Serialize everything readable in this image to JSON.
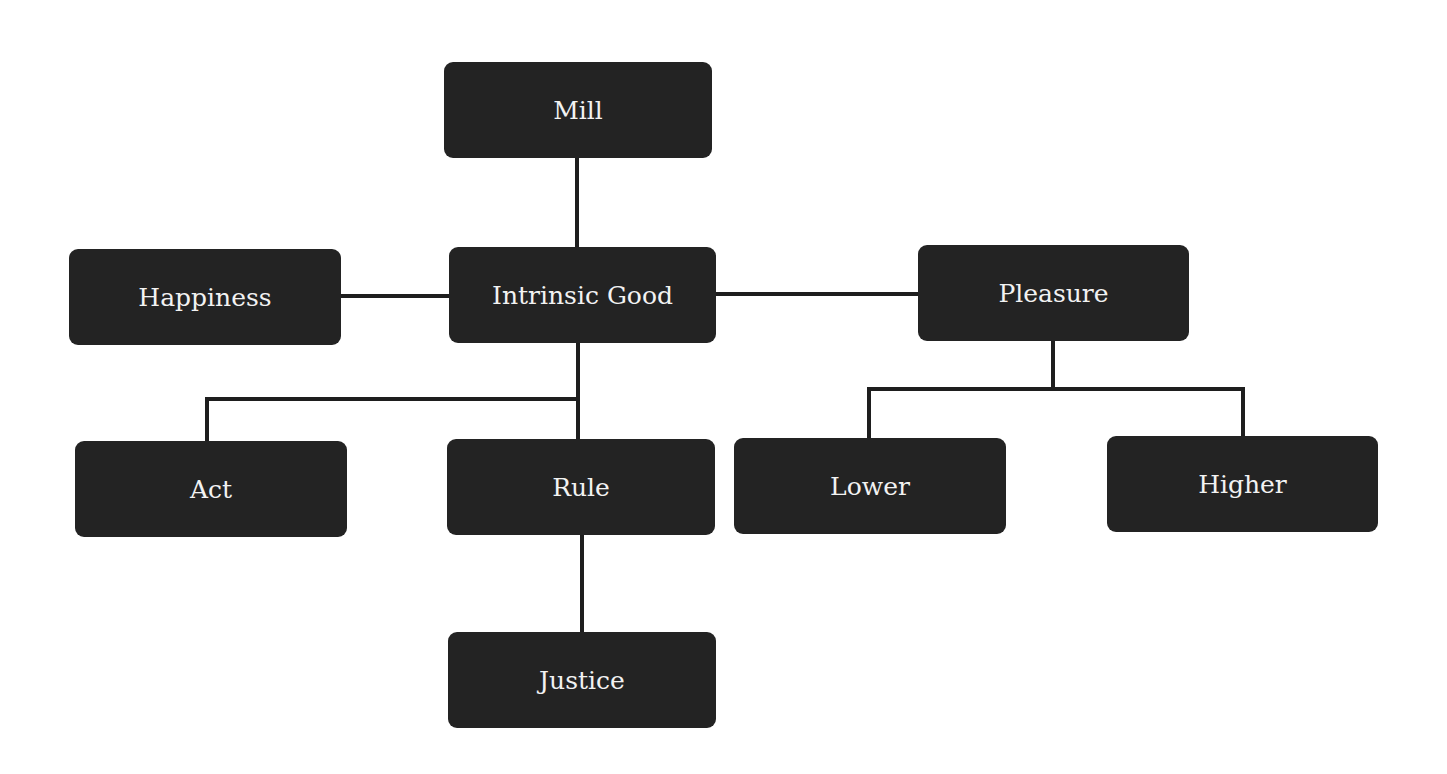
{
  "diagram": {
    "type": "hierarchy",
    "root": "Mill",
    "nodes": {
      "mill": {
        "label": "Mill"
      },
      "happiness": {
        "label": "Happiness"
      },
      "intrinsic_good": {
        "label": "Intrinsic Good"
      },
      "pleasure": {
        "label": "Pleasure"
      },
      "act": {
        "label": "Act"
      },
      "rule": {
        "label": "Rule"
      },
      "lower": {
        "label": "Lower"
      },
      "higher": {
        "label": "Higher"
      },
      "justice": {
        "label": "Justice"
      }
    },
    "edges": [
      {
        "from": "Mill",
        "to": "Intrinsic Good"
      },
      {
        "from": "Intrinsic Good",
        "to": "Happiness"
      },
      {
        "from": "Intrinsic Good",
        "to": "Pleasure"
      },
      {
        "from": "Intrinsic Good",
        "to": "Act"
      },
      {
        "from": "Intrinsic Good",
        "to": "Rule"
      },
      {
        "from": "Rule",
        "to": "Justice"
      },
      {
        "from": "Pleasure",
        "to": "Lower"
      },
      {
        "from": "Pleasure",
        "to": "Higher"
      }
    ],
    "colors": {
      "node_fill": "#232323",
      "node_text": "#f2f2f2",
      "connector": "#1e1e1e",
      "background": "#ffffff"
    }
  }
}
